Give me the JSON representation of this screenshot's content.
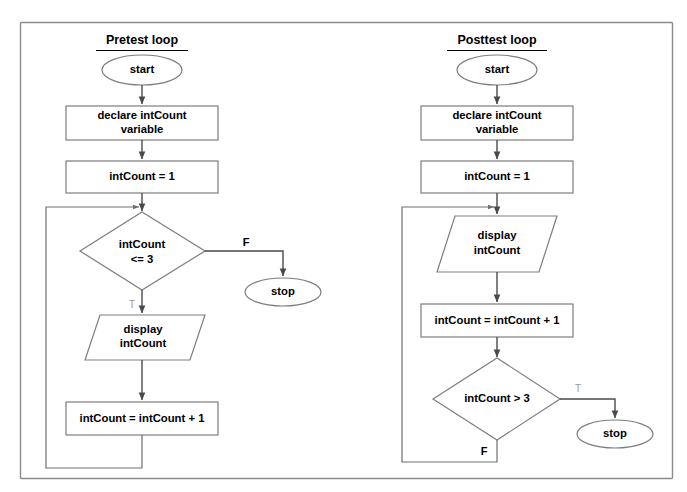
{
  "page": {
    "background_color": "#ffffff",
    "border_color": "#8a8a8a",
    "shape_stroke_color": "#7d7d7d",
    "connector_color": "#4a4a4a",
    "text_color": "#000000"
  },
  "diagram": {
    "type": "flowchart",
    "panels": [
      {
        "id": "pretest",
        "title": "Pretest loop",
        "nodes": [
          {
            "id": "p-start",
            "shape": "terminator",
            "text": "start"
          },
          {
            "id": "p-declare",
            "shape": "process",
            "text": "declare intCount variable",
            "line1": "declare intCount",
            "line2": "variable"
          },
          {
            "id": "p-init",
            "shape": "process",
            "text": "intCount = 1"
          },
          {
            "id": "p-cond",
            "shape": "decision",
            "text": "intCount <= 3",
            "line1": "intCount",
            "line2": "<= 3"
          },
          {
            "id": "p-display",
            "shape": "input-output",
            "text": "display intCount",
            "line1": "display",
            "line2": "intCount"
          },
          {
            "id": "p-incr",
            "shape": "process",
            "text": "intCount = intCount + 1"
          },
          {
            "id": "p-stop",
            "shape": "terminator",
            "text": "stop"
          }
        ],
        "edges": [
          {
            "from": "p-start",
            "to": "p-declare",
            "label": ""
          },
          {
            "from": "p-declare",
            "to": "p-init",
            "label": ""
          },
          {
            "from": "p-init",
            "to": "p-cond",
            "label": ""
          },
          {
            "from": "p-cond",
            "to": "p-stop",
            "label": "F"
          },
          {
            "from": "p-cond",
            "to": "p-display",
            "label": "T"
          },
          {
            "from": "p-display",
            "to": "p-incr",
            "label": ""
          },
          {
            "from": "p-incr",
            "to": "p-cond",
            "label": ""
          }
        ]
      },
      {
        "id": "posttest",
        "title": "Posttest loop",
        "nodes": [
          {
            "id": "q-start",
            "shape": "terminator",
            "text": "start"
          },
          {
            "id": "q-declare",
            "shape": "process",
            "text": "declare intCount variable",
            "line1": "declare intCount",
            "line2": "variable"
          },
          {
            "id": "q-init",
            "shape": "process",
            "text": "intCount = 1"
          },
          {
            "id": "q-display",
            "shape": "input-output",
            "text": "display intCount",
            "line1": "display",
            "line2": "intCount"
          },
          {
            "id": "q-incr",
            "shape": "process",
            "text": "intCount = intCount + 1"
          },
          {
            "id": "q-cond",
            "shape": "decision",
            "text": "intCount > 3"
          },
          {
            "id": "q-stop",
            "shape": "terminator",
            "text": "stop"
          }
        ],
        "edges": [
          {
            "from": "q-start",
            "to": "q-declare",
            "label": ""
          },
          {
            "from": "q-declare",
            "to": "q-init",
            "label": ""
          },
          {
            "from": "q-init",
            "to": "q-display",
            "label": ""
          },
          {
            "from": "q-display",
            "to": "q-incr",
            "label": ""
          },
          {
            "from": "q-incr",
            "to": "q-cond",
            "label": ""
          },
          {
            "from": "q-cond",
            "to": "q-stop",
            "label": "T"
          },
          {
            "from": "q-cond",
            "to": "q-display",
            "label": "F"
          }
        ]
      }
    ]
  },
  "labels": {
    "pretest_title": "Pretest loop",
    "posttest_title": "Posttest loop",
    "start": "start",
    "stop": "stop",
    "declare_line1": "declare intCount",
    "declare_line2": "variable",
    "init": "intCount = 1",
    "pretest_cond_line1": "intCount",
    "pretest_cond_line2": "<= 3",
    "display_line1": "display",
    "display_line2": "intCount",
    "increment": "intCount = intCount + 1",
    "posttest_cond": "intCount > 3",
    "branch_false": "F",
    "branch_true": "T"
  }
}
